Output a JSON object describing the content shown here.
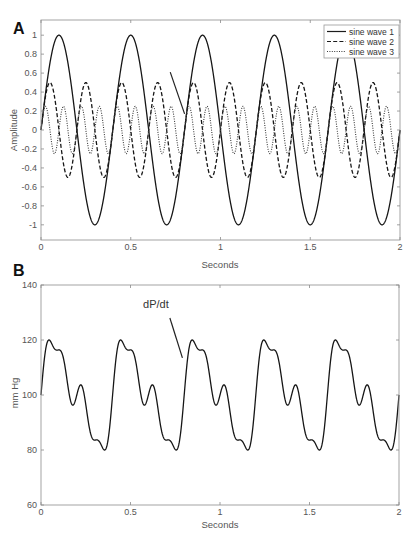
{
  "figure": {
    "panel_a": {
      "label": "A",
      "ylabel": "Amplitude",
      "xlabel": "Seconds",
      "legend": [
        "sine wave 1",
        "sine wave 2",
        "sine wave 3"
      ]
    },
    "panel_b": {
      "label": "B",
      "ylabel": "mm Hg",
      "xlabel": "Seconds",
      "annotation_text": "dP/dt"
    },
    "colors": {
      "curve": "#161616",
      "axis": "#9a9a9a",
      "text": "#555555",
      "background": "#ffffff"
    }
  },
  "chart_data": [
    {
      "type": "line",
      "panel": "A",
      "title": "",
      "xlabel": "Seconds",
      "ylabel": "Amplitude",
      "xlim": [
        0,
        2
      ],
      "ylim": [
        -1.16,
        1.16
      ],
      "xticks": [
        0,
        0.5,
        1,
        1.5,
        2
      ],
      "xtick_labels": [
        "0",
        "0.5",
        "1",
        "1.5",
        "2"
      ],
      "yticks": [
        -1,
        -0.8,
        -0.6,
        -0.4,
        -0.2,
        0,
        0.2,
        0.4,
        0.6,
        0.8,
        1
      ],
      "ytick_labels": [
        "-1",
        "-0.8",
        "-0.6",
        "-0.4",
        "-0.2",
        "0",
        "0.2",
        "0.4",
        "0.6",
        "0.8",
        "1"
      ],
      "grid": false,
      "legend_position": "upper right",
      "series": [
        {
          "name": "sine wave 1",
          "amplitude": 1.0,
          "frequency_hz": 2.5,
          "phase": 0,
          "line_style": "solid",
          "peak_times_s": [
            0.1,
            0.5,
            0.9,
            1.3,
            1.7
          ],
          "trough_times_s": [
            0.3,
            0.7,
            1.1,
            1.5,
            1.9
          ]
        },
        {
          "name": "sine wave 2",
          "amplitude": 0.5,
          "frequency_hz": 5,
          "phase": 0,
          "line_style": "dashed",
          "peak_times_s": [
            0.05,
            0.25,
            0.45,
            0.65,
            0.85,
            1.05,
            1.25,
            1.45,
            1.65,
            1.85
          ]
        },
        {
          "name": "sine wave 3",
          "amplitude": 0.25,
          "frequency_hz": 10,
          "phase": 0,
          "line_style": "dotted",
          "period_s": 0.1
        }
      ],
      "annotations": [
        {
          "type": "arrow",
          "from": [
            0.72,
            0.61
          ],
          "to": [
            0.8,
            0.17
          ]
        }
      ]
    },
    {
      "type": "line",
      "panel": "B",
      "title": "",
      "xlabel": "Seconds",
      "ylabel": "mm Hg",
      "xlim": [
        0,
        2
      ],
      "ylim": [
        60,
        140
      ],
      "xticks": [
        0,
        0.5,
        1,
        1.5,
        2
      ],
      "xtick_labels": [
        "0",
        "0.5",
        "1",
        "1.5",
        "2"
      ],
      "yticks": [
        60,
        80,
        100,
        120,
        140
      ],
      "ytick_labels": [
        "60",
        "80",
        "100",
        "120",
        "140"
      ],
      "grid": false,
      "series": [
        {
          "name": "pressure",
          "line_style": "solid",
          "model": "baseline + gain * (sine wave 1 + sine wave 2 + sine wave 3)",
          "baseline": 100,
          "gain": 16.4,
          "start_value": 100,
          "peak_value": 120,
          "peak_times_s": [
            0.045,
            0.445,
            0.845,
            1.245,
            1.645
          ],
          "shoulder_value": 116.5,
          "shoulder_times_s": [
            0.1,
            0.5,
            0.9,
            1.3,
            1.7
          ],
          "notch_value": 96.5,
          "notch_times_s": [
            0.18,
            0.58,
            0.98,
            1.38,
            1.78
          ],
          "secondary_peak_value": 103.5,
          "secondary_peak_times_s": [
            0.22,
            0.62,
            1.02,
            1.42,
            1.82
          ],
          "min_value": 80,
          "min_times_s": [
            0.355,
            0.755,
            1.155,
            1.555,
            1.955
          ]
        }
      ],
      "annotations": [
        {
          "type": "arrow",
          "text": "dP/dt",
          "text_at": [
            0.57,
            131.5
          ],
          "from": [
            0.72,
            128
          ],
          "to": [
            0.79,
            113.5
          ]
        }
      ]
    }
  ]
}
